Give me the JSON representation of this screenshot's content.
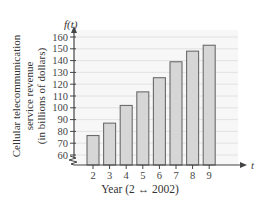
{
  "chart_data": {
    "type": "bar",
    "title": "",
    "function_label": "f(t)",
    "xlabel": "Year (2 ↔ 2002)",
    "x_axis_var": "t",
    "ylabel_lines": [
      "Cellular telecommunication",
      "service revenue",
      "(in billions of dollars)"
    ],
    "categories": [
      "2",
      "3",
      "4",
      "5",
      "6",
      "7",
      "8",
      "9"
    ],
    "values": [
      76.5,
      87,
      102,
      113.5,
      125.5,
      139,
      148,
      153
    ],
    "ylim": [
      60,
      160
    ],
    "yticks": [
      60,
      70,
      80,
      90,
      100,
      110,
      120,
      130,
      140,
      150,
      160
    ],
    "axis_break": true,
    "grid": true,
    "colors": {
      "bar_fill": "#d6d6d6",
      "bar_edge": "#6b6b6b",
      "grid": "#e2e2e2",
      "axis": "#444444",
      "plot_bg": "#f7f7f7"
    }
  }
}
